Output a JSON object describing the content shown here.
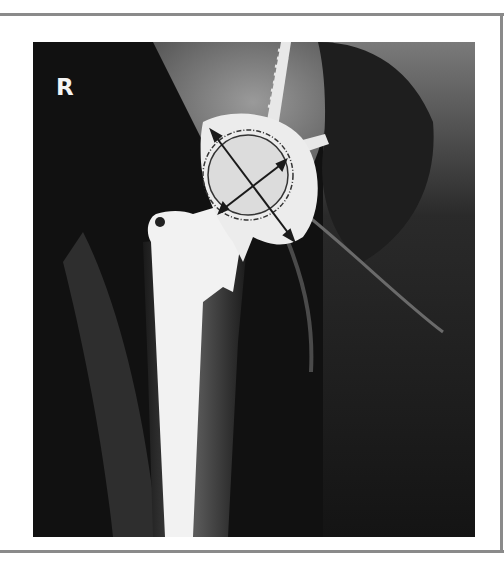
{
  "image": {
    "description": "Anteroposterior hip radiograph showing a total hip arthroplasty with femoral stem, femoral head, acetabular cup and screws, annotated with two measurement arrows across the cup",
    "side_marker": "R",
    "colors": {
      "background": "#ffffff",
      "frame_line": "#8a8a8a",
      "film_dark": "#111111",
      "implant": "#f2f2f2",
      "bone": "#8c8c8c",
      "annotation": "#1a1a1a"
    }
  }
}
